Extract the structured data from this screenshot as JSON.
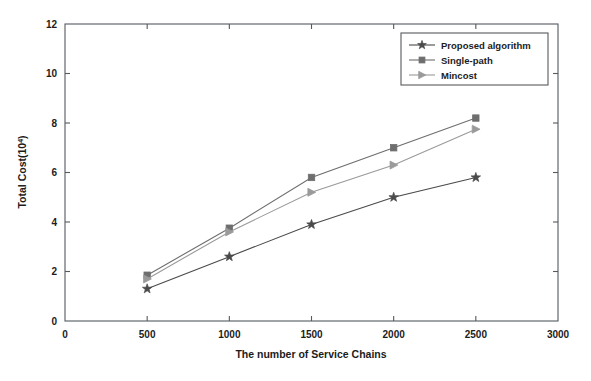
{
  "chart_data": {
    "type": "line",
    "title": "",
    "xlabel": "The number of Service Chains",
    "ylabel": "Total Cost(10",
    "ylabel_sup": "4",
    "ylabel_tail": ")",
    "x": [
      500,
      1000,
      1500,
      2000,
      2500
    ],
    "xlim": [
      0,
      3000
    ],
    "ylim": [
      0,
      12
    ],
    "xticks": [
      0,
      500,
      1000,
      1500,
      2000,
      2500,
      3000
    ],
    "yticks": [
      0,
      2,
      4,
      6,
      8,
      10,
      12
    ],
    "xtick_labels": [
      "0",
      "500",
      "1000",
      "1500",
      "2000",
      "2500",
      "3000"
    ],
    "ytick_labels": [
      "0",
      "2",
      "4",
      "6",
      "8",
      "10",
      "12"
    ],
    "grid": false,
    "legend_position": "top-right",
    "series": [
      {
        "name": "Proposed algorithm",
        "marker": "star",
        "color": "#4a4a4a",
        "values": [
          1.3,
          2.6,
          3.9,
          5.0,
          5.8
        ]
      },
      {
        "name": "Single-path",
        "marker": "square",
        "color": "#6e6e6e",
        "values": [
          1.85,
          3.75,
          5.8,
          7.0,
          8.2
        ]
      },
      {
        "name": "Mincost",
        "marker": "triangle-right",
        "color": "#9a9a9a",
        "values": [
          1.7,
          3.6,
          5.2,
          6.3,
          7.75
        ]
      }
    ]
  },
  "legend": {
    "entries": [
      {
        "label": "Proposed algorithm"
      },
      {
        "label": "Single-path"
      },
      {
        "label": "Mincost"
      }
    ]
  },
  "colors": {
    "axis": "#555a5e",
    "text": "#1c1c1c",
    "background": "#ffffff",
    "series_proposed": "#4a4a4a",
    "series_single_path": "#6e6e6e",
    "series_mincost": "#9a9a9a"
  }
}
